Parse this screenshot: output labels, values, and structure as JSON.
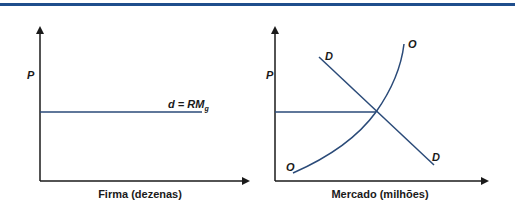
{
  "colors": {
    "rule": "#1f4e8c",
    "curve": "#2a4a78",
    "axis": "#1a1a1a"
  },
  "left_panel": {
    "y_axis_label": "P",
    "x_axis_label": "Firma (dezenas)",
    "line_label_main": "d = RM",
    "line_label_sub": "g"
  },
  "right_panel": {
    "y_axis_label": "P",
    "x_axis_label": "Mercado (milhões)",
    "demand_label_top": "D",
    "demand_label_bottom": "D",
    "supply_label_top": "O",
    "supply_label_bottom": "O"
  }
}
